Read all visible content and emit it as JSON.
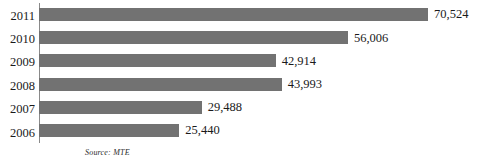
{
  "chart_data": {
    "type": "bar",
    "orientation": "horizontal",
    "title": "",
    "subtitle": "",
    "xlabel": "",
    "ylabel": "",
    "categories": [
      "2011",
      "2010",
      "2009",
      "2008",
      "2007",
      "2006"
    ],
    "values": [
      70524,
      56006,
      42914,
      43993,
      29488,
      25440
    ],
    "value_labels": [
      "70,524",
      "56,006",
      "42,914",
      "43,993",
      "29,488",
      "25,440"
    ],
    "series": [
      {
        "name": "",
        "values": [
          70524,
          56006,
          42914,
          43993,
          29488,
          25440
        ]
      }
    ],
    "xlim": [
      0,
      70524
    ],
    "grid": false,
    "legend": false,
    "legend_position": "none",
    "bar_color": "#727272",
    "axis_color": "#8a8a8a",
    "text_color": "#1a1a1a",
    "background": "#ffffff",
    "annotations": [
      "Source: MTE"
    ]
  },
  "chart": {
    "source_note": "Source: MTE",
    "bars": [
      {
        "year": "2011",
        "value": 70524,
        "label": "70,524"
      },
      {
        "year": "2010",
        "value": 56006,
        "label": "56,006"
      },
      {
        "year": "2009",
        "value": 42914,
        "label": "42,914"
      },
      {
        "year": "2008",
        "value": 43993,
        "label": "43,993"
      },
      {
        "year": "2007",
        "value": 29488,
        "label": "29,488"
      },
      {
        "year": "2006",
        "value": 25440,
        "label": "25,440"
      }
    ]
  }
}
